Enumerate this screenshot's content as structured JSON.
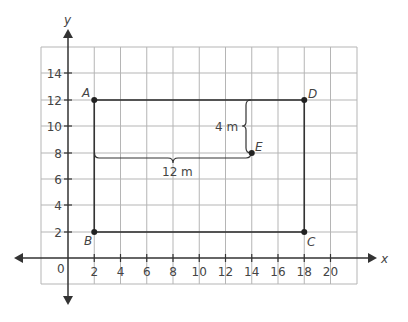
{
  "axes": {
    "x_label": "x",
    "y_label": "y",
    "origin_label": "0",
    "x_ticks": [
      "2",
      "4",
      "6",
      "8",
      "10",
      "12",
      "14",
      "16",
      "18",
      "20"
    ],
    "y_ticks": [
      "2",
      "4",
      "6",
      "8",
      "10",
      "12",
      "14"
    ]
  },
  "points": {
    "A": {
      "label": "A",
      "x": 2,
      "y": 12
    },
    "B": {
      "label": "B",
      "x": 2,
      "y": 2
    },
    "C": {
      "label": "C",
      "x": 18,
      "y": 2
    },
    "D": {
      "label": "D",
      "x": 18,
      "y": 12
    },
    "E": {
      "label": "E",
      "x": 14,
      "y": 8
    }
  },
  "measurements": {
    "vertical": "4 m",
    "horizontal": "12 m"
  }
}
